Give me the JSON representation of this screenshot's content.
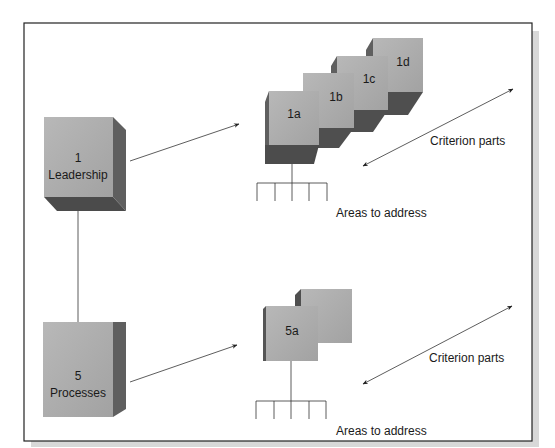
{
  "diagram": {
    "colors": {
      "box_front": "#a9a9a9",
      "box_front_light": "#bdbdbd",
      "box_side": "#5e5e5e",
      "box_bottom": "#4a4a4a",
      "frame": "#222222",
      "shadow": "#d6d6d6",
      "line": "#333333"
    },
    "main_boxes": [
      {
        "number": "1",
        "label": "Leadership"
      },
      {
        "number": "5",
        "label": "Processes"
      }
    ],
    "upper_group": {
      "items": [
        "1a",
        "1b",
        "1c",
        "1d"
      ],
      "criterion_label": "Criterion parts",
      "areas_label": "Areas to address",
      "area_ticks": 5
    },
    "lower_group": {
      "items": [
        "5a",
        ""
      ],
      "criterion_label": "Criterion parts",
      "areas_label": "Areas to address",
      "area_ticks": 5
    }
  }
}
